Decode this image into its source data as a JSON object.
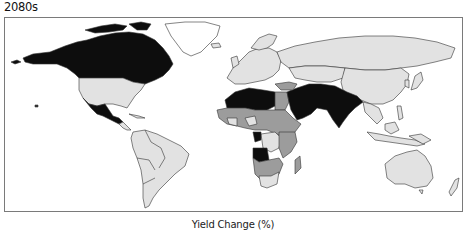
{
  "title": "2080s",
  "caption": "Yield Change (%)",
  "map": {
    "type": "choropleth",
    "variable": "Yield Change (%)",
    "period": "2080s",
    "colors": {
      "dark": "#0d0d0d",
      "mid": "#9c9c9c",
      "light": "#e2e2e2",
      "none": "#ffffff",
      "border": "#333333",
      "frame": "#7a7a7a"
    },
    "regions": {
      "dark": [
        "Canada",
        "Mexico",
        "Central America",
        "North Africa (Sahara)",
        "Arabian Peninsula",
        "Iran",
        "Pakistan",
        "India",
        "Angola",
        "Congo",
        "Horn of Africa"
      ],
      "mid": [
        "West Africa",
        "Central Africa",
        "East Africa",
        "Southern Africa",
        "Egypt",
        "Turkey",
        "Europe (parts)"
      ],
      "light": [
        "United States",
        "South America",
        "Europe",
        "Russia",
        "China",
        "Central Asia",
        "Southeast Asia",
        "Australia",
        "New Zealand",
        "Japan",
        "South Africa",
        "Madagascar"
      ],
      "none": [
        "Greenland",
        "Antarctica"
      ]
    }
  }
}
